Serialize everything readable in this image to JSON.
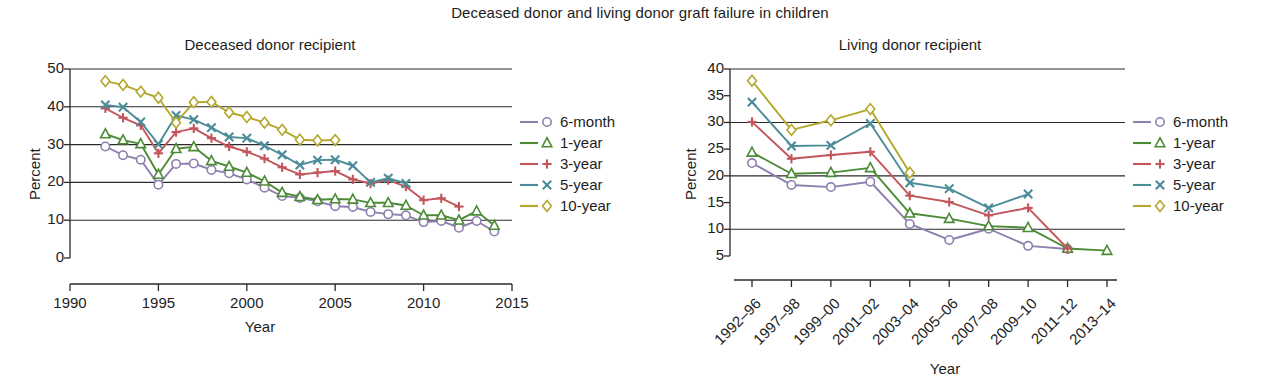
{
  "figure": {
    "title": "Deceased donor and living donor graft failure in children"
  },
  "legend": {
    "items": [
      {
        "label": "6-month",
        "color": "#8d7fae",
        "marker": "circle"
      },
      {
        "label": "1-year",
        "color": "#4c8b36",
        "marker": "triangle"
      },
      {
        "label": "3-year",
        "color": "#c3565c",
        "marker": "plus"
      },
      {
        "label": "5-year",
        "color": "#4c8c99",
        "marker": "x"
      },
      {
        "label": "10-year",
        "color": "#b5a72b",
        "marker": "diamond"
      }
    ]
  },
  "chart_data": [
    {
      "type": "line",
      "id": "deceased-donor-recipient",
      "title": "Deceased donor recipient",
      "xlabel": "Year",
      "ylabel": "Percent",
      "xlim": [
        1990,
        2015
      ],
      "ylim": [
        0,
        50
      ],
      "xticks": [
        1990,
        1995,
        2000,
        2005,
        2010,
        2015
      ],
      "yticks": [
        0,
        10,
        20,
        30,
        40,
        50
      ],
      "gridlines": [
        10,
        20,
        30,
        40,
        50
      ],
      "grid": true,
      "legend_position": "right",
      "series": [
        {
          "name": "6-month",
          "color": "#8d7fae",
          "marker": "circle",
          "x": [
            1992,
            1993,
            1994,
            1995,
            1996,
            1997,
            1998,
            1999,
            2000,
            2001,
            2002,
            2003,
            2004,
            2005,
            2006,
            2007,
            2008,
            2009,
            2010,
            2011,
            2012,
            2013,
            2014
          ],
          "values": [
            29.5,
            27.2,
            26.0,
            19.4,
            24.9,
            25.0,
            23.3,
            22.4,
            20.8,
            18.6,
            16.4,
            15.9,
            15.0,
            13.7,
            13.5,
            12.2,
            11.6,
            11.3,
            9.5,
            9.8,
            8.0,
            9.8,
            7.0
          ]
        },
        {
          "name": "1-year",
          "color": "#4c8b36",
          "marker": "triangle",
          "x": [
            1992,
            1993,
            1994,
            1995,
            1996,
            1997,
            1998,
            1999,
            2000,
            2001,
            2002,
            2003,
            2004,
            2005,
            2006,
            2007,
            2008,
            2009,
            2010,
            2011,
            2012,
            2013,
            2014
          ],
          "values": [
            32.8,
            31.2,
            30.2,
            22.1,
            28.9,
            29.4,
            25.7,
            24.2,
            22.6,
            20.3,
            17.3,
            16.2,
            15.4,
            15.6,
            15.5,
            14.6,
            14.6,
            13.9,
            11.3,
            11.3,
            10.0,
            12.4,
            8.6
          ]
        },
        {
          "name": "3-year",
          "color": "#c3565c",
          "marker": "plus",
          "x": [
            1992,
            1993,
            1994,
            1995,
            1996,
            1997,
            1998,
            1999,
            2000,
            2001,
            2002,
            2003,
            2004,
            2005,
            2006,
            2007,
            2008,
            2009,
            2010,
            2011,
            2012
          ],
          "values": [
            39.6,
            37.1,
            35.1,
            27.7,
            33.3,
            34.3,
            31.7,
            29.5,
            28.1,
            26.3,
            24.0,
            22.1,
            22.6,
            23.0,
            20.8,
            19.7,
            20.6,
            18.9,
            15.3,
            15.8,
            13.6
          ]
        },
        {
          "name": "5-year",
          "color": "#4c8c99",
          "marker": "x",
          "x": [
            1992,
            1993,
            1994,
            1995,
            1996,
            1997,
            1998,
            1999,
            2000,
            2001,
            2002,
            2003,
            2004,
            2005,
            2006,
            2007,
            2008,
            2009
          ],
          "values": [
            40.5,
            39.9,
            36.0,
            30.1,
            37.7,
            36.6,
            34.5,
            32.0,
            31.7,
            29.7,
            27.3,
            24.6,
            25.9,
            26.0,
            24.4,
            20.0,
            21.1,
            19.7
          ]
        },
        {
          "name": "10-year",
          "color": "#b5a72b",
          "marker": "diamond",
          "x": [
            1992,
            1993,
            1994,
            1995,
            1996,
            1997,
            1998,
            1999,
            2000,
            2001,
            2002,
            2003,
            2004,
            2005
          ],
          "values": [
            46.8,
            45.8,
            44.0,
            42.4,
            35.8,
            41.2,
            41.3,
            38.5,
            37.3,
            35.8,
            33.9,
            31.3,
            31.1,
            31.2
          ]
        }
      ]
    },
    {
      "type": "line",
      "id": "living-donor-recipient",
      "title": "Living donor recipient",
      "xlabel": "Year",
      "ylabel": "Percent",
      "ylim": [
        5,
        40
      ],
      "categories": [
        "1992–96",
        "1997–98",
        "1999–00",
        "2001–02",
        "2003–04",
        "2005–06",
        "2007–08",
        "2009–10",
        "2011–12",
        "2013–14"
      ],
      "yticks": [
        5,
        10,
        15,
        20,
        25,
        30,
        35,
        40
      ],
      "gridlines": [
        10,
        20,
        30,
        40
      ],
      "grid": true,
      "legend_position": "right",
      "series": [
        {
          "name": "6-month",
          "color": "#8d7fae",
          "marker": "circle",
          "values": [
            22.4,
            18.3,
            17.9,
            18.9,
            11.0,
            8.0,
            10.1,
            6.9,
            6.3,
            null
          ]
        },
        {
          "name": "1-year",
          "color": "#4c8b36",
          "marker": "triangle",
          "values": [
            24.4,
            20.4,
            20.6,
            21.5,
            13.0,
            12.0,
            10.6,
            10.3,
            6.4,
            6.0
          ]
        },
        {
          "name": "3-year",
          "color": "#c3565c",
          "marker": "plus",
          "values": [
            30.1,
            23.2,
            23.9,
            24.5,
            16.3,
            15.1,
            12.6,
            14.0,
            6.4,
            null
          ]
        },
        {
          "name": "5-year",
          "color": "#4c8c99",
          "marker": "x",
          "values": [
            33.8,
            25.6,
            25.7,
            29.8,
            18.7,
            17.6,
            14.0,
            16.6,
            null,
            null
          ]
        },
        {
          "name": "10-year",
          "color": "#b5a72b",
          "marker": "diamond",
          "values": [
            37.8,
            28.6,
            30.4,
            32.5,
            20.6,
            null,
            null,
            null,
            null,
            null
          ]
        }
      ]
    }
  ]
}
